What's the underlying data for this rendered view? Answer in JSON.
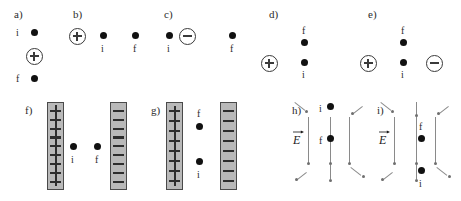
{
  "figure": {
    "colors": {
      "dot": "#111111",
      "plate_fill": "#b9b9b9",
      "plate_border": "#4a4a4a",
      "field_line": "#8a8a8a",
      "charge_outline": "#3a3a3a",
      "background": "#ffffff"
    }
  },
  "panels": {
    "a": {
      "label": "a)",
      "layout": "vertical",
      "initial_tag": "i",
      "final_tag": "f",
      "source_charge": "+",
      "description": "i above, positive charge in middle, f below"
    },
    "b": {
      "label": "b)",
      "layout": "horizontal",
      "initial_tag": "i",
      "final_tag": "f",
      "source_charge": "+",
      "description": "positive charge at left, then i, then f to the right"
    },
    "c": {
      "label": "c)",
      "layout": "horizontal",
      "initial_tag": "i",
      "final_tag": "f",
      "source_charge": "−",
      "description": "i at left, negative charge beside it, f far to the right"
    },
    "d": {
      "label": "d)",
      "layout": "vertical-with-left-charge",
      "initial_tag": "i",
      "final_tag": "f",
      "source_charge": "+",
      "description": "positive charge at left, f above i in a vertical column"
    },
    "e": {
      "label": "e)",
      "layout": "vertical-between-two-charges",
      "initial_tag": "i",
      "final_tag": "f",
      "left_charge": "+",
      "right_charge": "−",
      "description": "positive charge at left, f above i, negative charge at right"
    },
    "f": {
      "label": "f)",
      "layout": "parallel-plates",
      "left_plate_sign": "+",
      "right_plate_sign": "−",
      "left_plate_count": 9,
      "right_plate_count": 9,
      "initial_tag": "i",
      "final_tag": "f",
      "description": "i near positive plate, f near negative plate, horizontal arrangement"
    },
    "g": {
      "label": "g)",
      "layout": "parallel-plates",
      "left_plate_sign": "+",
      "right_plate_sign": "−",
      "left_plate_count": 8,
      "right_plate_count": 8,
      "initial_tag": "i",
      "final_tag": "f",
      "description": "f above i, both between the plates"
    },
    "h": {
      "label": "h)",
      "layout": "field-lines",
      "field_label": "E",
      "initial_tag": "i",
      "final_tag": "f",
      "field_direction": "downward",
      "description": "i at top, f below, downward field lines fanning outward"
    },
    "i": {
      "label": "i)",
      "layout": "field-lines",
      "field_label": "E",
      "initial_tag": "i",
      "final_tag": "f",
      "field_direction": "downward",
      "description": "f above i, downward field lines fanning outward"
    }
  }
}
